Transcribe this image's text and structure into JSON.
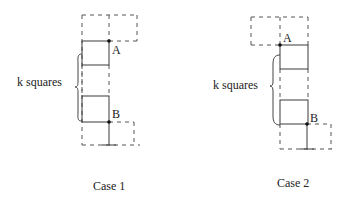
{
  "diagram": {
    "panels": [
      {
        "id": "case1",
        "caption": "Case 1",
        "brace_label": "k squares",
        "point_a": "A",
        "point_b": "B",
        "caption_pos": [
          93,
          190
        ],
        "brace_label_pos": [
          18,
          86
        ],
        "brace": {
          "x": 82,
          "y1": 54,
          "y2": 121,
          "tip": 75
        },
        "dashed_frame": {
          "left": 82,
          "right": 137,
          "top": 15,
          "mid_x": 109
        },
        "top_dashed_box": {
          "x1": 109,
          "x2": 137,
          "y1": 15,
          "y2": 41
        },
        "square_top": {
          "x": 82,
          "y": 41,
          "w": 27,
          "h": 24
        },
        "square_bottom": {
          "x": 82,
          "y": 96,
          "w": 27,
          "h": 26
        },
        "a_dot": [
          109,
          41
        ],
        "a_label_pos": [
          113,
          53
        ],
        "b_dot": [
          109,
          122
        ],
        "b_label_pos": [
          113,
          118
        ],
        "bottom_y": 145,
        "bottom_dashed_box": {
          "x1": 109,
          "x2": 134,
          "y1": 122,
          "y2": 145
        }
      },
      {
        "id": "case2",
        "caption": "Case 2",
        "brace_label": "k squares",
        "point_a": "A",
        "point_b": "B",
        "caption_pos": [
          277,
          187
        ],
        "brace_label_pos": [
          213,
          89
        ],
        "brace": {
          "x": 280,
          "y1": 55,
          "y2": 125,
          "tip": 270
        },
        "dashed_frame": {
          "left": 280,
          "right": 308,
          "top": 17,
          "mid_x": 280
        },
        "top_dashed_box": {
          "x1": 251,
          "x2": 280,
          "y1": 17,
          "y2": 45
        },
        "square_top": {
          "x": 280,
          "y": 45,
          "w": 28,
          "h": 24
        },
        "square_bottom": {
          "x": 280,
          "y": 100,
          "w": 28,
          "h": 24
        },
        "a_dot": [
          280,
          45
        ],
        "a_label_pos": [
          283,
          42
        ],
        "b_dot": [
          307,
          124
        ],
        "b_label_pos": [
          311,
          122
        ],
        "bottom_y": 149,
        "bottom_dashed_box": {
          "x1": 307,
          "x2": 331,
          "y1": 124,
          "y2": 149
        }
      }
    ]
  }
}
